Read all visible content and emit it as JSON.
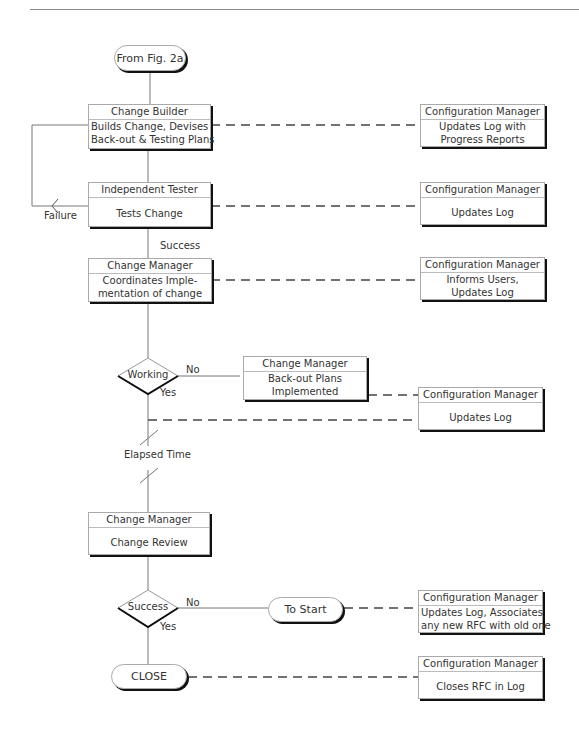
{
  "diagram": {
    "start_terminal": "From Fig. 2a",
    "builder": {
      "role": "Change Builder",
      "line1": "Builds Change, Devises",
      "line2": "Back-out  & Testing Plans"
    },
    "tester": {
      "role": "Independent Tester",
      "line1": "Tests Change"
    },
    "manager_impl": {
      "role": "Change  Manager",
      "line1": "Coordinates  Imple-",
      "line2": "mentation  of  change"
    },
    "decision_working": "Working",
    "backout": {
      "role": "Change  Manager",
      "line1": "Back-out Plans",
      "line2": "Implemented"
    },
    "review": {
      "role": "Change Manager",
      "line1": "Change Review"
    },
    "decision_success": "Success",
    "to_start_terminal": "To Start",
    "close_terminal": "CLOSE",
    "labels": {
      "failure": "Failure",
      "success": "Success",
      "no1": "No",
      "yes1": "Yes",
      "elapsed": "Elapsed Time",
      "no2": "No",
      "yes2": "Yes"
    },
    "config_boxes": [
      {
        "role": "Configuration Manager",
        "line1": "Updates Log with",
        "line2": "Progress Reports"
      },
      {
        "role": "Configuration Manager",
        "line1": "Updates Log",
        "line2": ""
      },
      {
        "role": "Configuration Manager",
        "line1": "Informs Users,",
        "line2": "Updates Log"
      },
      {
        "role": "Configuration Manager",
        "line1": "Updates Log",
        "line2": ""
      },
      {
        "role": "Configuration Manager",
        "line1": "Updates Log, Associates",
        "line2": "any new RFC with old one"
      },
      {
        "role": "Configuration Manager",
        "line1": "Closes RFC in Log",
        "line2": ""
      }
    ]
  }
}
